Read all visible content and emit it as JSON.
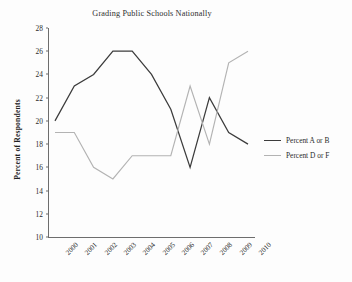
{
  "chart_data": {
    "type": "line",
    "title": "Grading Public Schools Nationally",
    "xlabel": "",
    "ylabel": "Percent of Respondents",
    "categories": [
      "2000",
      "2001",
      "2002",
      "2003",
      "2004",
      "2005",
      "2006",
      "2007",
      "2008",
      "2009",
      "2010"
    ],
    "x_tick_labels": [
      "2000",
      "2001",
      "2002",
      "2003",
      "2004",
      "2005",
      "2006",
      "2007",
      "2008",
      "2009",
      "2010"
    ],
    "y_tick_labels": [
      "28",
      "26",
      "24",
      "22",
      "20",
      "18",
      "16",
      "14",
      "12",
      "10"
    ],
    "y_ticks": [
      28,
      26,
      24,
      22,
      20,
      18,
      16,
      14,
      12,
      10
    ],
    "ylim": [
      10,
      28
    ],
    "grid": false,
    "legend_position": "right",
    "series": [
      {
        "name": "Percent  A or B",
        "color": "#3c3c3c",
        "values": [
          20,
          23,
          24,
          26,
          26,
          24,
          21,
          16,
          22,
          19,
          18
        ]
      },
      {
        "name": "Percent  D or F",
        "color": "#b3b3b3",
        "values": [
          19,
          19,
          16,
          15,
          17,
          17,
          17,
          23,
          18,
          25,
          26
        ]
      }
    ]
  },
  "legend": {
    "items": [
      {
        "label": "Percent  A or B",
        "color": "#3c3c3c"
      },
      {
        "label": "Percent  D or F",
        "color": "#b3b3b3"
      }
    ]
  },
  "axes": {
    "line_color": "#6d6d6d"
  }
}
